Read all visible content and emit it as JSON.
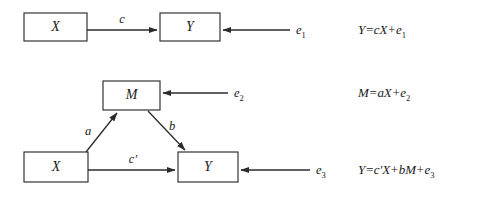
{
  "figure": {
    "background_color": "#ffffff",
    "line_color": "#2b2b2b",
    "text_color": "#1a1a1a"
  },
  "panels": [
    {
      "id": "direct-effect-panel",
      "name": "Direct effect model",
      "nodes": [
        {
          "id": "x-top",
          "label": "X"
        },
        {
          "id": "y-top",
          "label": "Y"
        }
      ],
      "paths": [
        {
          "id": "path-c",
          "label": "c",
          "from": "X",
          "to": "Y"
        }
      ],
      "errors": [
        {
          "id": "e1",
          "base": "e",
          "subscript": "1"
        }
      ],
      "equation": {
        "id": "equation-1",
        "lhs": "Y",
        "rhs_parts": [
          "=cX+e",
          "1"
        ],
        "plain": "Y=cX+e1"
      }
    },
    {
      "id": "mediation-panel",
      "name": "Mediated effect model",
      "nodes": [
        {
          "id": "m-mid",
          "label": "M"
        },
        {
          "id": "x-bottom",
          "label": "X"
        },
        {
          "id": "y-bottom",
          "label": "Y"
        }
      ],
      "paths": [
        {
          "id": "path-a",
          "label": "a",
          "from": "X",
          "to": "M"
        },
        {
          "id": "path-b",
          "label": "b",
          "from": "M",
          "to": "Y"
        },
        {
          "id": "path-c-prime",
          "label": "c′",
          "from": "X",
          "to": "Y"
        }
      ],
      "errors": [
        {
          "id": "e2",
          "base": "e",
          "subscript": "2"
        },
        {
          "id": "e3",
          "base": "e",
          "subscript": "3"
        }
      ],
      "equations": [
        {
          "id": "equation-2",
          "lhs": "M",
          "rhs_parts": [
            "=aX+e",
            "2"
          ],
          "plain": "M=aX+e2"
        },
        {
          "id": "equation-3",
          "lhs": "Y",
          "rhs_parts": [
            "=c′X+bM+e",
            "3"
          ],
          "plain": "Y=c′X+bM+e3"
        }
      ]
    }
  ]
}
